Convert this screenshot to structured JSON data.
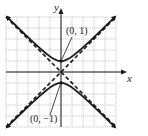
{
  "chart_data": {
    "type": "line",
    "title": "",
    "xlabel": "x",
    "ylabel": "y",
    "xlim": [
      -5,
      5
    ],
    "ylim": [
      -5,
      5
    ],
    "grid": true,
    "series": [
      {
        "name": "hyperbola upper branch",
        "equation": "y^2 - x^2 = 1",
        "style": "solid",
        "x": [
          -5,
          -4,
          -3,
          -2,
          -1,
          0,
          1,
          2,
          3,
          4,
          5
        ],
        "y": [
          5.1,
          4.12,
          3.16,
          2.24,
          1.41,
          1,
          1.41,
          2.24,
          3.16,
          4.12,
          5.1
        ]
      },
      {
        "name": "hyperbola lower branch",
        "equation": "y^2 - x^2 = 1",
        "style": "solid",
        "x": [
          -5,
          -4,
          -3,
          -2,
          -1,
          0,
          1,
          2,
          3,
          4,
          5
        ],
        "y": [
          -5.1,
          -4.12,
          -3.16,
          -2.24,
          -1.41,
          -1,
          -1.41,
          -2.24,
          -3.16,
          -4.12,
          -5.1
        ]
      },
      {
        "name": "asymptote y = x",
        "style": "dashed",
        "x": [
          -5,
          5
        ],
        "y": [
          -5,
          5
        ]
      },
      {
        "name": "asymptote y = -x",
        "style": "dashed",
        "x": [
          -5,
          5
        ],
        "y": [
          5,
          -5
        ]
      }
    ],
    "points": [
      {
        "label": "(0, 1)",
        "x": 0,
        "y": 1
      },
      {
        "label": "(0, −1)",
        "x": 0,
        "y": -1
      }
    ],
    "colors": {
      "curve": "#1a1a1a",
      "grid": "#9a9a9a",
      "axis": "#1a1a1a"
    }
  },
  "labels": {
    "x_axis": "x",
    "y_axis": "y",
    "vertex_top": "(0, 1)",
    "vertex_bottom": "(0, −1)"
  }
}
